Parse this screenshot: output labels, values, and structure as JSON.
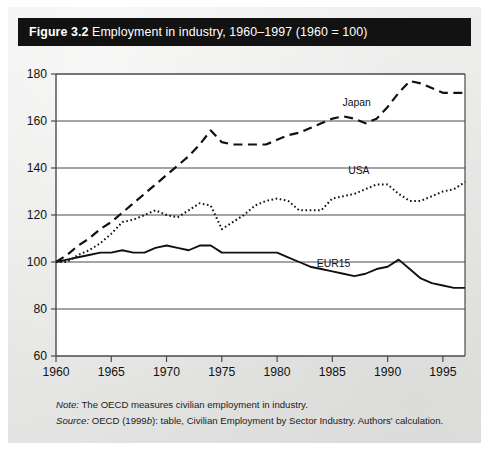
{
  "figure": {
    "number_label": "Figure 3.2",
    "caption": "Employment in industry, 1960–1997 (1960 = 100)",
    "bar_color": "#121212",
    "page_background": "#e9e9e7",
    "plot_background": "#ffffff"
  },
  "notes": {
    "note_lead": "Note:",
    "note_text": "The OECD measures civilian employment in industry.",
    "source_lead": "Source:",
    "source_text_pre": "OECD (1999",
    "source_text_ital": "b",
    "source_text_post": "): table, Civilian Employment by Sector Industry. Authors' calculation."
  },
  "chart_data": {
    "type": "line",
    "title": "Employment in industry, 1960–1997 (1960 = 100)",
    "xlabel": "",
    "ylabel": "",
    "xlim": [
      1960,
      1997
    ],
    "ylim": [
      60,
      180
    ],
    "yticks": [
      60,
      80,
      100,
      120,
      140,
      160,
      180
    ],
    "xticks": [
      1960,
      1965,
      1970,
      1975,
      1980,
      1985,
      1990,
      1995
    ],
    "grid": "horizontal",
    "legend": "inline-labels",
    "x": [
      1960,
      1961,
      1962,
      1963,
      1964,
      1965,
      1966,
      1967,
      1968,
      1969,
      1970,
      1971,
      1972,
      1973,
      1974,
      1975,
      1976,
      1977,
      1978,
      1979,
      1980,
      1981,
      1982,
      1983,
      1984,
      1985,
      1986,
      1987,
      1988,
      1989,
      1990,
      1991,
      1992,
      1993,
      1994,
      1995,
      1996,
      1997
    ],
    "series": [
      {
        "name": "Japan",
        "style": "dashed",
        "color": "#111111",
        "label_x": 1987.2,
        "label_y": 166.5,
        "values": [
          100,
          103,
          107,
          110,
          114,
          117,
          121,
          125,
          129,
          133,
          137,
          141,
          145,
          150,
          156,
          151,
          150,
          150,
          150,
          150,
          152,
          154,
          155,
          157,
          159,
          161,
          162,
          161,
          159,
          161,
          166,
          172,
          177,
          176,
          174,
          172,
          172,
          172
        ]
      },
      {
        "name": "USA",
        "style": "dotted",
        "color": "#111111",
        "label_x": 1987.4,
        "label_y": 137.5,
        "values": [
          100,
          100,
          103,
          105,
          108,
          112,
          117,
          118,
          120,
          122,
          120,
          119,
          122,
          125,
          124,
          114,
          117,
          120,
          124,
          126,
          127,
          126,
          122,
          122,
          122,
          127,
          128,
          129,
          131,
          133,
          133,
          129,
          126,
          126,
          128,
          130,
          131,
          134
        ]
      },
      {
        "name": "EUR15",
        "style": "solid",
        "color": "#111111",
        "label_x": 1985.1,
        "label_y": 97.8,
        "values": [
          100,
          101,
          102,
          103,
          104,
          104,
          105,
          104,
          104,
          106,
          107,
          106,
          105,
          107,
          107,
          104,
          104,
          104,
          104,
          104,
          104,
          102,
          100,
          98,
          97,
          96,
          95,
          94,
          95,
          97,
          98,
          101,
          97,
          93,
          91,
          90,
          89,
          89
        ]
      }
    ]
  },
  "axis": {
    "y_tick_labels": [
      "180",
      "160",
      "140",
      "120",
      "100",
      "80",
      "60"
    ],
    "x_tick_labels": [
      "1960",
      "1965",
      "1970",
      "1975",
      "1980",
      "1985",
      "1990",
      "1995"
    ]
  }
}
